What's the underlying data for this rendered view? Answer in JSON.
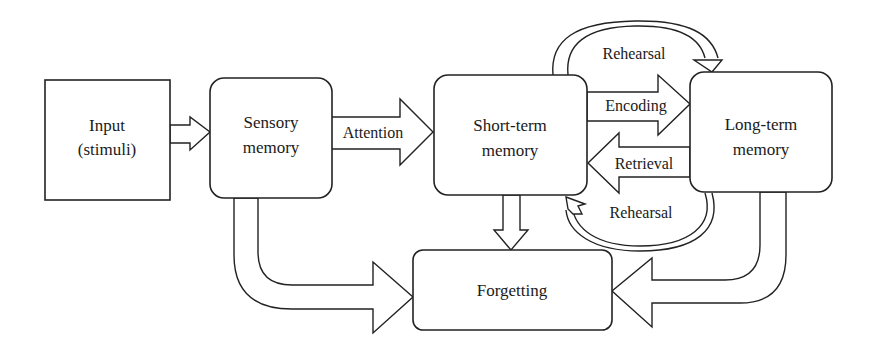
{
  "diagram": {
    "nodes": {
      "input": {
        "line1": "Input",
        "line2": "(stimuli)"
      },
      "sensory": {
        "line1": "Sensory",
        "line2": "memory"
      },
      "short_term": {
        "line1": "Short-term",
        "line2": "memory"
      },
      "long_term": {
        "line1": "Long-term",
        "line2": "memory"
      },
      "forgetting": {
        "label": "Forgetting"
      }
    },
    "edges": {
      "attention": "Attention",
      "encoding": "Encoding",
      "retrieval": "Retrieval",
      "rehearsal_top": "Rehearsal",
      "rehearsal_bottom": "Rehearsal"
    },
    "colors": {
      "stroke": "#222222",
      "fill": "#ffffff",
      "text": "#1a1a1a"
    }
  }
}
